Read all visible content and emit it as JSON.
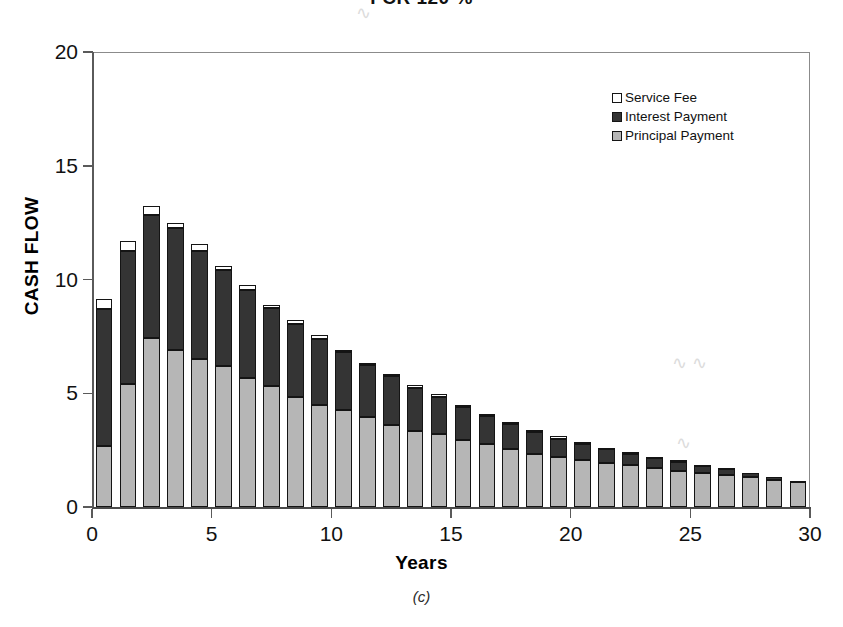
{
  "title": "FCR 120 %",
  "caption": "(c)",
  "legend": {
    "position": "top-right",
    "items": [
      {
        "label": "Service Fee",
        "swatch": "white-square-icon",
        "color": "#ffffff"
      },
      {
        "label": "Interest Payment",
        "swatch": "dark-square-icon",
        "color": "#343434"
      },
      {
        "label": "Principal Payment",
        "swatch": "lightgray-square-icon",
        "color": "#b6b6b6"
      }
    ]
  },
  "axes": {
    "y": {
      "label": "CASH FLOW",
      "ticks": [
        "0",
        "5",
        "10",
        "15",
        "20"
      ],
      "min": 0,
      "max": 20
    },
    "x": {
      "label": "Years",
      "ticks": [
        "0",
        "5",
        "10",
        "15",
        "20",
        "25",
        "30"
      ],
      "min": 0,
      "max": 30
    }
  },
  "chart_data": {
    "type": "bar",
    "stacked": true,
    "title": "FCR 120 %",
    "xlabel": "Years",
    "ylabel": "CASH FLOW",
    "xlim": [
      0,
      30
    ],
    "ylim": [
      0,
      20
    ],
    "grid": false,
    "legend_position": "top-right",
    "categories": [
      1,
      2,
      3,
      4,
      5,
      6,
      7,
      8,
      9,
      10,
      11,
      12,
      13,
      14,
      15,
      16,
      17,
      18,
      19,
      20,
      21,
      22,
      23,
      24,
      25,
      26,
      27,
      28,
      29,
      30
    ],
    "series": [
      {
        "name": "Principal Payment",
        "color": "#b6b6b6",
        "values": [
          2.7,
          5.4,
          7.45,
          6.9,
          6.5,
          6.2,
          5.65,
          5.3,
          4.85,
          4.5,
          4.25,
          3.95,
          3.6,
          3.35,
          3.2,
          2.95,
          2.75,
          2.55,
          2.35,
          2.2,
          2.05,
          1.95,
          1.85,
          1.7,
          1.6,
          1.5,
          1.4,
          1.3,
          1.2,
          1.1
        ]
      },
      {
        "name": "Interest Payment",
        "color": "#343434",
        "values": [
          6.0,
          5.85,
          5.4,
          5.35,
          4.75,
          4.2,
          3.9,
          3.45,
          3.2,
          2.9,
          2.55,
          2.3,
          2.15,
          1.9,
          1.65,
          1.45,
          1.25,
          1.1,
          0.95,
          0.8,
          0.7,
          0.6,
          0.5,
          0.45,
          0.4,
          0.3,
          0.25,
          0.2,
          0.1,
          0.05
        ]
      },
      {
        "name": "Service Fee",
        "color": "#ffffff",
        "values": [
          0.45,
          0.45,
          0.4,
          0.25,
          0.3,
          0.2,
          0.2,
          0.15,
          0.15,
          0.15,
          0.1,
          0.1,
          0.1,
          0.1,
          0.1,
          0.1,
          0.1,
          0.1,
          0.1,
          0.1,
          0.1,
          0.05,
          0.05,
          0.05,
          0.05,
          0.05,
          0.05,
          0.0,
          0.0,
          0.0
        ]
      }
    ],
    "totals": [
      9.15,
      11.7,
      13.25,
      12.5,
      11.55,
      10.6,
      9.75,
      8.9,
      8.2,
      7.55,
      6.9,
      6.35,
      5.85,
      5.35,
      4.95,
      4.5,
      4.1,
      3.75,
      3.4,
      3.1,
      2.85,
      2.6,
      2.4,
      2.2,
      2.05,
      1.85,
      1.7,
      1.5,
      1.3,
      1.15
    ]
  }
}
